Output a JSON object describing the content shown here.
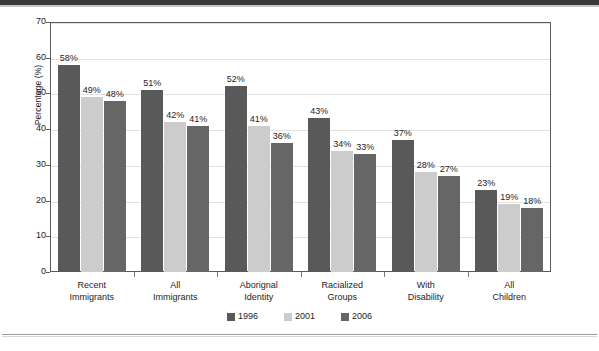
{
  "chart_data": {
    "type": "bar",
    "title": "",
    "subtitle": "",
    "xlabel": "",
    "ylabel": "Percentage (%)",
    "ylim": [
      0,
      70
    ],
    "ytick_step": 10,
    "ytick_labels": [
      "70",
      "60",
      "50",
      "40",
      "30",
      "20",
      "10",
      "0"
    ],
    "grid": true,
    "legend_position": "bottom-center",
    "value_label_suffix": "%",
    "categories": [
      "Recent\nImmigrants",
      "All\nImmigrants",
      "Aborignal\nIdentity",
      "Racialized\nGroups",
      "With\nDisability",
      "All\nChildren"
    ],
    "category_lines": [
      [
        "Recent",
        "Immigrants"
      ],
      [
        "All",
        "Immigrants"
      ],
      [
        "Aborignal",
        "Identity"
      ],
      [
        "Racialized",
        "Groups"
      ],
      [
        "With",
        "Disability"
      ],
      [
        "All",
        "Children"
      ]
    ],
    "series": [
      {
        "name": "1996",
        "color": "#595959",
        "values": [
          58,
          51,
          52,
          43,
          37,
          23
        ],
        "labels": [
          "58%",
          "51%",
          "52%",
          "43%",
          "37%",
          "23%"
        ]
      },
      {
        "name": "2001",
        "color": "#cccccc",
        "values": [
          49,
          42,
          41,
          34,
          28,
          19
        ],
        "labels": [
          "49%",
          "42%",
          "41%",
          "34%",
          "28%",
          "19%"
        ]
      },
      {
        "name": "2006",
        "color": "#666666",
        "values": [
          48,
          41,
          36,
          33,
          27,
          18
        ],
        "labels": [
          "48%",
          "41%",
          "36%",
          "33%",
          "27%",
          "18%"
        ]
      }
    ]
  },
  "legend": {
    "items": [
      {
        "label": "1996",
        "color": "#595959"
      },
      {
        "label": "2001",
        "color": "#cccccc"
      },
      {
        "label": "2006",
        "color": "#666666"
      }
    ]
  },
  "axis": {
    "y_title": "Percentage (%)"
  }
}
